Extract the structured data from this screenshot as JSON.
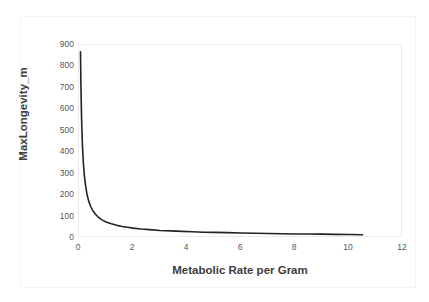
{
  "chart_data": {
    "type": "line",
    "title": "",
    "xlabel": "Metabolic Rate per Gram",
    "ylabel": "MaxLongevity_m",
    "xlim": [
      0,
      12
    ],
    "ylim": [
      0,
      900
    ],
    "xticks": [
      0,
      2,
      4,
      6,
      8,
      10,
      12
    ],
    "yticks": [
      0,
      100,
      200,
      300,
      400,
      500,
      600,
      700,
      800,
      900
    ],
    "grid": false,
    "legend": null,
    "line_color": "#222222",
    "series": [
      {
        "name": "MaxLongevity_m",
        "x": [
          0.055,
          0.07,
          0.09,
          0.11,
          0.13,
          0.16,
          0.2,
          0.25,
          0.3,
          0.36,
          0.43,
          0.5,
          0.6,
          0.7,
          0.8,
          0.9,
          1.0,
          1.2,
          1.4,
          1.6,
          1.8,
          2.0,
          2.3,
          2.6,
          3.0,
          3.4,
          3.8,
          4.2,
          4.6,
          5.0,
          5.5,
          6.0,
          6.5,
          7.0,
          7.5,
          8.0,
          8.5,
          9.0,
          9.5,
          10.0,
          10.5
        ],
        "y": [
          868,
          720,
          590,
          495,
          425,
          352,
          290,
          238,
          202,
          172,
          148,
          130,
          112,
          99,
          89,
          81,
          75,
          66,
          59,
          54,
          50,
          46,
          42,
          39,
          35,
          33,
          31,
          29,
          27,
          26,
          25,
          23,
          22,
          21,
          20,
          19,
          19,
          18,
          17,
          16,
          15
        ]
      }
    ]
  },
  "axes": {
    "y_labels": [
      "900",
      "800",
      "700",
      "600",
      "500",
      "400",
      "300",
      "200",
      "100",
      "0"
    ],
    "x_labels": [
      "0",
      "2",
      "4",
      "6",
      "8",
      "10",
      "12"
    ],
    "x_title": "Metabolic Rate per Gram",
    "y_title": "MaxLongevity_m"
  }
}
